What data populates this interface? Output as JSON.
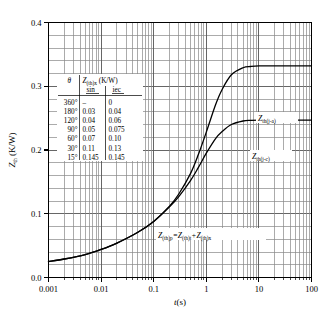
{
  "chart_data": {
    "type": "line",
    "title": "",
    "xlabel": "t(s)",
    "ylabel": "Zth (K/W)",
    "xscale": "log",
    "xlim": [
      0.001,
      100
    ],
    "ylim": [
      0.0,
      0.4
    ],
    "grid": true,
    "legend_position": "inline-right",
    "x_tick_labels": [
      "0.001",
      "0.01",
      "0.1",
      "1",
      "10",
      "100"
    ],
    "x_tick_values": [
      0.001,
      0.01,
      0.1,
      1,
      10,
      100
    ],
    "y_tick_labels": [
      "0.0",
      "0.1",
      "0.2",
      "0.3",
      "0.4"
    ],
    "y_tick_values": [
      0.0,
      0.1,
      0.2,
      0.3,
      0.4
    ],
    "y_minor_step": 0.02,
    "series": [
      {
        "name": "Zth(j-a)",
        "x": [
          0.001,
          0.002,
          0.005,
          0.01,
          0.02,
          0.05,
          0.1,
          0.2,
          0.3,
          0.5,
          0.7,
          1,
          1.5,
          2,
          3,
          5,
          7,
          10,
          20,
          50,
          100
        ],
        "values": [
          0.025,
          0.029,
          0.036,
          0.044,
          0.054,
          0.071,
          0.088,
          0.112,
          0.131,
          0.163,
          0.192,
          0.228,
          0.271,
          0.295,
          0.318,
          0.329,
          0.331,
          0.332,
          0.332,
          0.332,
          0.332
        ]
      },
      {
        "name": "Zth(j-c)",
        "x": [
          0.001,
          0.002,
          0.005,
          0.01,
          0.02,
          0.05,
          0.1,
          0.2,
          0.3,
          0.5,
          0.7,
          1,
          1.5,
          2,
          3,
          5,
          7,
          10,
          20,
          50,
          100
        ],
        "values": [
          0.025,
          0.029,
          0.036,
          0.044,
          0.054,
          0.071,
          0.088,
          0.111,
          0.127,
          0.152,
          0.172,
          0.195,
          0.218,
          0.229,
          0.24,
          0.2455,
          0.2465,
          0.247,
          0.247,
          0.247,
          0.247
        ]
      }
    ],
    "annotations": [
      {
        "name": "formula",
        "text_parts": [
          "Z",
          "(th)p",
          "=Z",
          "(th)t",
          "+Z",
          "(th)x"
        ]
      },
      {
        "name": "curve-label-ja",
        "text": "Zth(j-a)"
      },
      {
        "name": "curve-label-jc",
        "text": "Zth(j-c)"
      }
    ]
  },
  "inset_table": {
    "header_col1": "θ",
    "header_col2_main": "Z",
    "header_col2_sub": "(th)x",
    "header_col2_unit": "(K/W)",
    "subheader_sin": "sin",
    "subheader_iec": "iec",
    "rows": [
      {
        "theta": "360°",
        "sin": "–",
        "iec": "0"
      },
      {
        "theta": "180°",
        "sin": "0.03",
        "iec": "0.04"
      },
      {
        "theta": "120°",
        "sin": "0.04",
        "iec": "0.06"
      },
      {
        "theta": "90°",
        "sin": "0.05",
        "iec": "0.075"
      },
      {
        "theta": "60°",
        "sin": "0.07",
        "iec": "0.10"
      },
      {
        "theta": "30°",
        "sin": "0.11",
        "iec": "0.13"
      },
      {
        "theta": "15°",
        "sin": "0.145",
        "iec": "0.145"
      }
    ]
  },
  "axes": {
    "y_title_main": "Z",
    "y_title_sub": "th",
    "y_title_unit": "(K/W)",
    "x_title_main": "t",
    "x_title_unit": "(s)"
  },
  "colors": {
    "curve": "#000000",
    "grid_major": "#555555",
    "grid_minor": "#888888",
    "axis": "#000000",
    "background": "#ffffff"
  }
}
